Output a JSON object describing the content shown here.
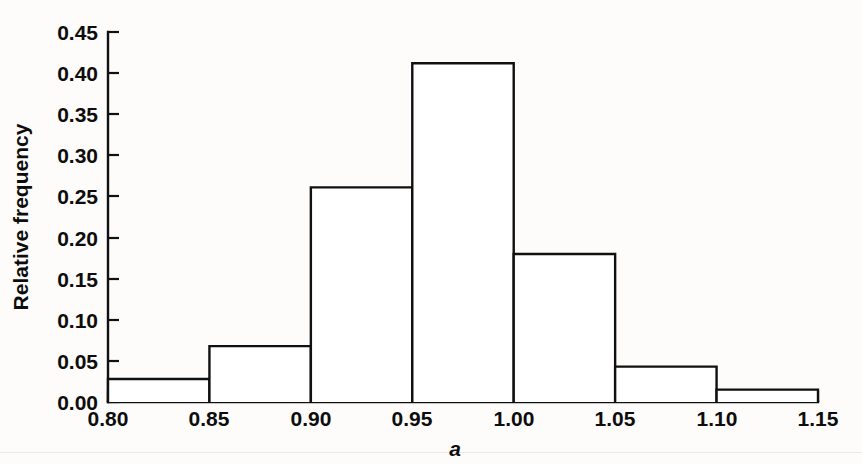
{
  "chart_data": {
    "type": "bar",
    "title": "",
    "subtitle": "",
    "xlabel": "a",
    "ylabel": "Relative frequency",
    "xlim": [
      0.8,
      1.15
    ],
    "ylim": [
      0.0,
      0.45
    ],
    "grid": false,
    "legend": null,
    "bin_width": 0.05,
    "bin_edges": [
      0.8,
      0.85,
      0.9,
      0.95,
      1.0,
      1.05,
      1.1,
      1.15
    ],
    "categories": [
      "0.80-0.85",
      "0.85-0.90",
      "0.90-0.95",
      "0.95-1.00",
      "1.00-1.05",
      "1.05-1.10",
      "1.10-1.15"
    ],
    "values": [
      0.028,
      0.068,
      0.261,
      0.412,
      0.18,
      0.043,
      0.015
    ],
    "x_ticks": [
      0.8,
      0.85,
      0.9,
      0.95,
      1.0,
      1.05,
      1.1,
      1.15
    ],
    "y_ticks": [
      0.0,
      0.05,
      0.1,
      0.15,
      0.2,
      0.25,
      0.3,
      0.35,
      0.4,
      0.45
    ],
    "x_tick_labels": [
      "0.80",
      "0.85",
      "0.90",
      "0.95",
      "1.00",
      "1.05",
      "1.10",
      "1.15"
    ],
    "y_tick_labels": [
      "0.00",
      "0.05",
      "0.10",
      "0.15",
      "0.20",
      "0.25",
      "0.30",
      "0.35",
      "0.40",
      "0.45"
    ],
    "colors": {
      "bar_fill": "#ffffff",
      "bar_stroke": "#101010",
      "axis": "#101010",
      "text": "#0d0d0d",
      "background": "#fdfcfa"
    }
  },
  "axes": {
    "y_title": "Relative frequency",
    "x_title": "a"
  },
  "y_ticks": [
    {
      "label": "0.45"
    },
    {
      "label": "0.40"
    },
    {
      "label": "0.35"
    },
    {
      "label": "0.30"
    },
    {
      "label": "0.25"
    },
    {
      "label": "0.20"
    },
    {
      "label": "0.15"
    },
    {
      "label": "0.10"
    },
    {
      "label": "0.05"
    },
    {
      "label": "0.00"
    }
  ],
  "x_ticks": [
    {
      "label": "0.80"
    },
    {
      "label": "0.85"
    },
    {
      "label": "0.90"
    },
    {
      "label": "0.95"
    },
    {
      "label": "1.00"
    },
    {
      "label": "1.05"
    },
    {
      "label": "1.10"
    },
    {
      "label": "1.15"
    }
  ]
}
